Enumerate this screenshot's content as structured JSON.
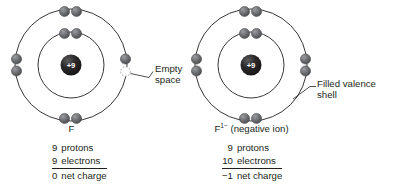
{
  "figure": {
    "colors": {
      "shell_stroke": "#231f20",
      "electron_fill": "#6d6e71",
      "electron_stroke": "#414042",
      "nucleus_fill": "#231f20",
      "nucleus_text": "#ffffff",
      "empty_dash": "#939598",
      "leader": "#231f20",
      "text": "#231f20",
      "background": "#ffffff"
    }
  },
  "left_atom": {
    "nucleus_label": "+9",
    "species_label": "F",
    "species_superscript": "",
    "species_suffix": "",
    "callout": {
      "line1": "Empty",
      "line2": "space"
    },
    "shells": {
      "inner_electrons": 2,
      "outer_electrons": 7,
      "outer_empty_slots": 1
    },
    "tally": {
      "rows": [
        {
          "count": "9",
          "label": "protons"
        },
        {
          "count": "9",
          "label": "electrons"
        }
      ],
      "total": {
        "count": "0",
        "label": "net charge"
      }
    }
  },
  "right_atom": {
    "nucleus_label": "+9",
    "species_label": "F",
    "species_superscript": "1−",
    "species_suffix": " (negative ion)",
    "callout": {
      "line1": "Filled valence",
      "line2": "shell"
    },
    "shells": {
      "inner_electrons": 2,
      "outer_electrons": 8,
      "outer_empty_slots": 0
    },
    "tally": {
      "rows": [
        {
          "count": "9",
          "label": "protons"
        },
        {
          "count": "10",
          "label": "electrons"
        }
      ],
      "total": {
        "count": "−1",
        "label": "net charge"
      }
    }
  }
}
